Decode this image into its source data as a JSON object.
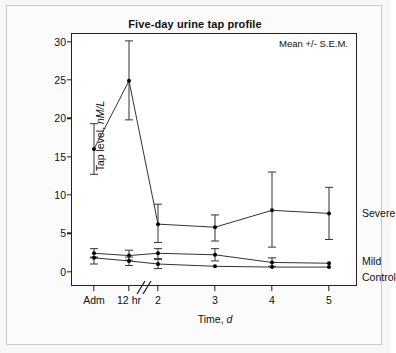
{
  "chart_data": {
    "type": "line",
    "title": "Five-day urine tap profile",
    "xlabel": "Time, d",
    "ylabel": "Tap level, nM/L",
    "ylabel_plain": "Tap level, ",
    "ylabel_italic": "nM/L",
    "xlabel_plain": "Time, ",
    "xlabel_italic": "d",
    "annotation": "Mean +/- S.E.M.",
    "grid": false,
    "legend_position": "right-inline",
    "axis_break": {
      "present": true,
      "between": [
        "12 hr",
        "2"
      ],
      "symbol": "//"
    },
    "categories": [
      "Adm",
      "12 hr",
      "2",
      "3",
      "4",
      "5"
    ],
    "x_tick_labels": [
      "Adm",
      "12 hr",
      "2",
      "3",
      "4",
      "5"
    ],
    "ylim": [
      -2,
      31
    ],
    "y_ticks": [
      0,
      5,
      10,
      15,
      20,
      25,
      30
    ],
    "y_tick_labels": [
      "0",
      "5",
      "10",
      "15",
      "20",
      "25",
      "30"
    ],
    "error_type": "S.E.M.",
    "series": [
      {
        "name": "Severe",
        "values": [
          16.0,
          24.9,
          6.2,
          5.8,
          8.0,
          7.6
        ],
        "err_low": [
          12.7,
          19.8,
          3.8,
          4.0,
          3.2,
          4.2
        ],
        "err_high": [
          19.3,
          30.1,
          8.8,
          7.4,
          13.0,
          11.0
        ]
      },
      {
        "name": "Mild",
        "values": [
          2.4,
          2.1,
          2.4,
          2.2,
          1.2,
          1.1
        ],
        "err_low": [
          1.9,
          1.5,
          1.7,
          1.4,
          0.7,
          1.1
        ],
        "err_high": [
          3.0,
          2.8,
          3.0,
          3.0,
          1.8,
          1.1
        ]
      },
      {
        "name": "Control",
        "values": [
          1.8,
          1.4,
          1.0,
          0.7,
          0.6,
          0.6
        ],
        "err_low": [
          1.0,
          0.8,
          0.4,
          0.7,
          0.6,
          0.6
        ],
        "err_high": [
          1.8,
          1.9,
          1.6,
          0.7,
          0.6,
          0.6
        ]
      }
    ]
  },
  "colors": {
    "line": "#333333",
    "marker": "#000000",
    "axis": "#222222",
    "background": "#ffffff",
    "card": "#fbfbfb",
    "page": "#f7f7f7"
  }
}
